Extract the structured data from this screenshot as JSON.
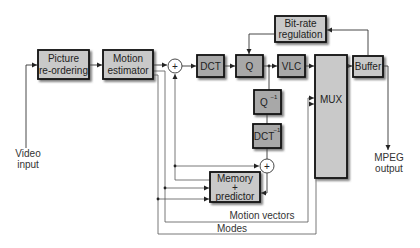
{
  "diagram": {
    "colors": {
      "box_fill_light": "#c9c9c9",
      "box_fill_dark": "#a8a8a8",
      "box_border": "#111111",
      "shadow": "#555555",
      "line": "#333333",
      "feedback_line": "#666666",
      "text": "#222222"
    },
    "blocks": {
      "picture_reordering": {
        "line1": "Picture",
        "line2": "re-ordering"
      },
      "motion_estimator": {
        "line1": "Motion",
        "line2": "estimator"
      },
      "dct": {
        "label": "DCT"
      },
      "q": {
        "label": "Q"
      },
      "vlc": {
        "label": "VLC"
      },
      "mux": {
        "label": "MUX"
      },
      "buffer": {
        "label": "Buffer"
      },
      "bitrate_regulation": {
        "line1": "Bit-rate",
        "line2": "regulation"
      },
      "q_inverse": {
        "label": "Q",
        "superscript": "−1"
      },
      "dct_inverse": {
        "label": "DCT",
        "superscript": "−1"
      },
      "memory_predictor": {
        "line1": "Memory",
        "line2": "+",
        "line3": "predictor"
      }
    },
    "adders": {
      "adder_main": {
        "symbol": "+"
      },
      "adder_reconstruct": {
        "symbol": "+"
      }
    },
    "io": {
      "input": {
        "line1": "Video",
        "line2": "input"
      },
      "output": {
        "line1": "MPEG",
        "line2": "output"
      }
    },
    "signals": {
      "motion_vectors": "Motion vectors",
      "modes": "Modes"
    }
  }
}
